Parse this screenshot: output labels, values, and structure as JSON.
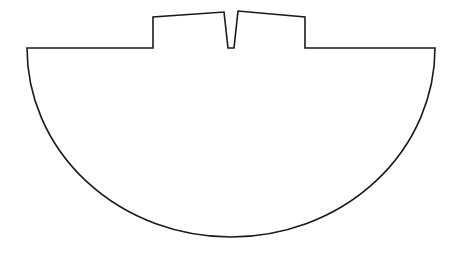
{
  "diagram": {
    "stroke_color": "#1a1a1a",
    "background_color": "#ffffff",
    "outline_path": "M 27 48 L 153 48 L 153 17 L 224 12 L 228 48 L 234 48 L 238 11 L 305 17 L 305 48 L 435 48 A 204 189 0 0 1 27 48 Z"
  }
}
